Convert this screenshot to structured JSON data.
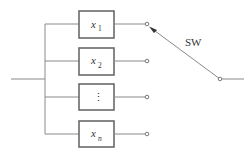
{
  "diagram": {
    "type": "selector-switch-circuit",
    "switch_label": "SW",
    "blocks": [
      {
        "var": "x",
        "sub": "1"
      },
      {
        "var": "x",
        "sub": "2"
      },
      {
        "var": "⋮",
        "sub": ""
      },
      {
        "var": "x",
        "sub": "n"
      }
    ],
    "colors": {
      "wire": "#8a8a8a",
      "box": "#6a6a6a",
      "text": "#333333"
    }
  }
}
